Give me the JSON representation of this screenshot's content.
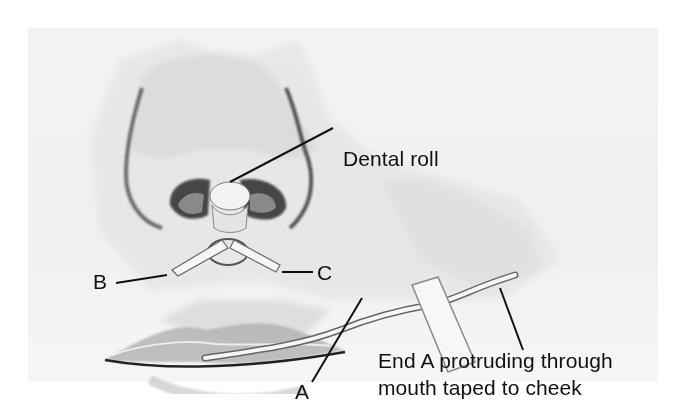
{
  "figure": {
    "labels": {
      "dental_roll": "Dental roll",
      "b": "B",
      "c": "C",
      "a": "A",
      "end_a_line1": "End A protruding through",
      "end_a_line2": "mouth taped to cheek"
    },
    "colors": {
      "background": "#ffffff",
      "skin_wash": "#e6e6e6",
      "shadow": "#9a9a9a",
      "ink": "#111111",
      "packing": "#f4f4f4"
    }
  }
}
